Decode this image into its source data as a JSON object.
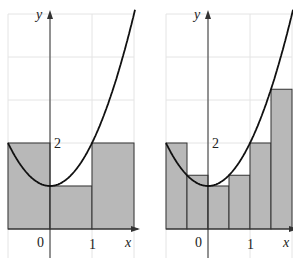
{
  "chart_data": [
    {
      "type": "area",
      "title": "Riemann sum (left endpoints), n = 3",
      "function": "y = x^2 + 1",
      "xlabel": "x",
      "ylabel": "y",
      "xlim": [
        -1,
        2
      ],
      "ylim": [
        0,
        5
      ],
      "tick_labels": {
        "x": [
          "0",
          "1"
        ],
        "y": [
          "2"
        ]
      },
      "rectangles": [
        {
          "x0": -1,
          "x1": 0,
          "height": 2
        },
        {
          "x0": 0,
          "x1": 1,
          "height": 1
        },
        {
          "x0": 1,
          "x1": 2,
          "height": 2
        }
      ]
    },
    {
      "type": "area",
      "title": "Riemann sum (left endpoints), n = 6",
      "function": "y = x^2 + 1",
      "xlabel": "x",
      "ylabel": "y",
      "xlim": [
        -1,
        2
      ],
      "ylim": [
        0,
        5
      ],
      "tick_labels": {
        "x": [
          "0",
          "1"
        ],
        "y": [
          "2"
        ]
      },
      "rectangles": [
        {
          "x0": -1,
          "x1": -0.5,
          "height": 2
        },
        {
          "x0": -0.5,
          "x1": 0,
          "height": 1.25
        },
        {
          "x0": 0,
          "x1": 0.5,
          "height": 1
        },
        {
          "x0": 0.5,
          "x1": 1,
          "height": 1.25
        },
        {
          "x0": 1,
          "x1": 1.5,
          "height": 2
        },
        {
          "x0": 1.5,
          "x1": 2,
          "height": 3.25
        }
      ]
    }
  ],
  "labels": {
    "x": "x",
    "y": "y",
    "zero": "0",
    "one": "1",
    "two": "2"
  },
  "colors": {
    "fill": "#b8b8b8",
    "stroke": "#333333",
    "grid": "#e4e4e4",
    "curve": "#111111"
  }
}
